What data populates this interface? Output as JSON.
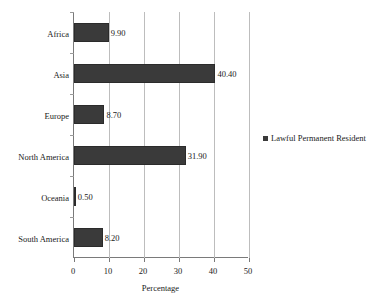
{
  "chart_data": {
    "type": "bar",
    "orientation": "horizontal",
    "title": "",
    "xlabel": "Percentage",
    "ylabel": "",
    "categories": [
      "Africa",
      "Asia",
      "Europe",
      "North America",
      "Oceania",
      "South America"
    ],
    "series": [
      {
        "name": "Lawful Permanent Resident",
        "values": [
          9.9,
          40.4,
          8.7,
          31.9,
          0.5,
          8.2
        ],
        "color": "#3a3a3a"
      }
    ],
    "data_labels": [
      "9.90",
      "40.40",
      "8.70",
      "31.90",
      "0.50",
      "8.20"
    ],
    "xlim": [
      0,
      50
    ],
    "xticks": [
      0,
      10,
      20,
      30,
      40,
      50
    ],
    "xtick_labels": [
      "0",
      "10",
      "20",
      "30",
      "40",
      "50"
    ],
    "grid": "vertical",
    "legend_position": "right",
    "legend_entries": [
      "Lawful Permanent Resident"
    ],
    "axis_color": "#7a7a7a",
    "grid_color": "#bdbdbd"
  }
}
